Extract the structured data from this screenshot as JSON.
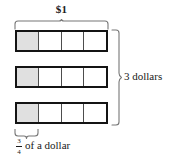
{
  "diagram": {
    "title_top": "$1",
    "label_right": "3 dollars",
    "fraction": {
      "numerator": "3",
      "denominator": "4"
    },
    "label_bottom_text": "of a dollar",
    "bars": [
      {
        "cells": [
          "shaded",
          "empty",
          "empty",
          "empty"
        ]
      },
      {
        "cells": [
          "shaded",
          "empty",
          "empty",
          "empty"
        ]
      },
      {
        "cells": [
          "shaded",
          "empty",
          "empty",
          "empty"
        ]
      }
    ],
    "colors": {
      "shaded_cell": "#e0e0e0",
      "bar_border": "#141414",
      "cell_divider": "#4d4d4d",
      "brace": "#777777",
      "text": "#1a1a1a"
    }
  }
}
